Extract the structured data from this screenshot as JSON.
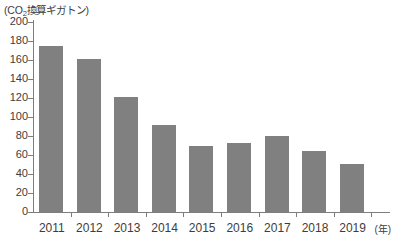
{
  "chart_data": {
    "type": "bar",
    "title": "",
    "unit_caption": "(CO₂換算ギガトン)",
    "unit_caption_parts": {
      "open": "(CO",
      "sub": "2",
      "rest": "換算ギガトン)"
    },
    "xlabel": "",
    "x_unit_label": "(年)",
    "ylabel": "",
    "ylim": [
      0,
      200
    ],
    "ytick_step": 20,
    "yticks": [
      0,
      20,
      40,
      60,
      80,
      100,
      120,
      140,
      160,
      180,
      200
    ],
    "ytick_labels": [
      "0",
      "20",
      "40",
      "60",
      "80",
      "100",
      "120",
      "140",
      "160",
      "180",
      "200"
    ],
    "grid": false,
    "legend": false,
    "categories": [
      "2011",
      "2012",
      "2013",
      "2014",
      "2015",
      "2016",
      "2017",
      "2018",
      "2019"
    ],
    "values": [
      175,
      161,
      121,
      92,
      70,
      73,
      80,
      64,
      51
    ],
    "bar_color": "#808080",
    "axis_color": "#7d7d7d",
    "text_color": "#3d3d3d",
    "background_color": "#ffffff"
  }
}
